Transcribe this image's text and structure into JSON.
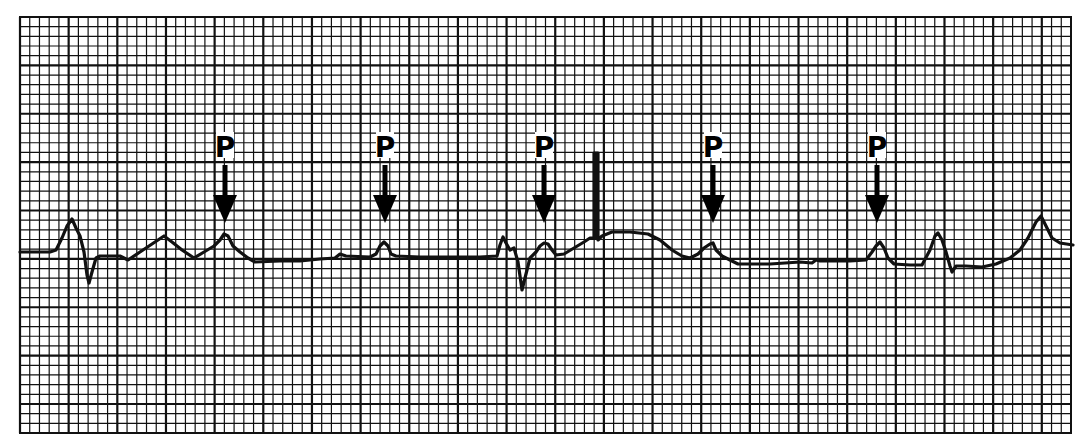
{
  "figure": {
    "kind": "ECG rhythm strip",
    "background_color": "#ffffff",
    "grid_color": "#111111",
    "trace_color": "#111111",
    "grid": {
      "left": 20,
      "top": 17,
      "right": 1071,
      "bottom": 433,
      "small_square_px": 9.74,
      "major_every": 5
    }
  },
  "annotations": {
    "marker_label": "P",
    "markers": [
      {
        "label": "P",
        "x": 225
      },
      {
        "label": "P",
        "x": 385
      },
      {
        "label": "P",
        "x": 544
      },
      {
        "label": "P",
        "x": 713
      },
      {
        "label": "P",
        "x": 877
      }
    ],
    "label_top": 133,
    "label_bottom": 157,
    "arrow_shaft_top": 165,
    "arrow_head_top": 195,
    "arrow_tip_y": 223
  },
  "trace": {
    "points": [
      [
        20,
        252
      ],
      [
        50,
        252
      ],
      [
        56,
        250
      ],
      [
        62,
        238
      ],
      [
        67,
        226
      ],
      [
        72,
        219
      ],
      [
        76,
        228
      ],
      [
        80,
        236
      ],
      [
        84,
        252
      ],
      [
        87,
        275
      ],
      [
        89,
        283
      ],
      [
        92,
        272
      ],
      [
        96,
        258
      ],
      [
        100,
        256
      ],
      [
        120,
        256
      ],
      [
        128,
        260
      ],
      [
        140,
        252
      ],
      [
        152,
        244
      ],
      [
        164,
        236
      ],
      [
        172,
        242
      ],
      [
        182,
        250
      ],
      [
        194,
        258
      ],
      [
        204,
        252
      ],
      [
        214,
        246
      ],
      [
        220,
        240
      ],
      [
        224,
        234
      ],
      [
        228,
        236
      ],
      [
        233,
        246
      ],
      [
        240,
        252
      ],
      [
        248,
        258
      ],
      [
        255,
        262
      ],
      [
        280,
        261
      ],
      [
        300,
        261
      ],
      [
        320,
        259
      ],
      [
        335,
        258
      ],
      [
        340,
        254
      ],
      [
        346,
        256
      ],
      [
        370,
        257
      ],
      [
        376,
        254
      ],
      [
        380,
        246
      ],
      [
        384,
        242
      ],
      [
        388,
        246
      ],
      [
        391,
        254
      ],
      [
        396,
        256
      ],
      [
        420,
        257
      ],
      [
        450,
        257
      ],
      [
        480,
        257
      ],
      [
        497,
        256
      ],
      [
        500,
        245
      ],
      [
        503,
        237
      ],
      [
        506,
        243
      ],
      [
        510,
        250
      ],
      [
        514,
        248
      ],
      [
        518,
        262
      ],
      [
        522,
        290
      ],
      [
        526,
        274
      ],
      [
        530,
        258
      ],
      [
        536,
        252
      ],
      [
        540,
        246
      ],
      [
        544,
        243
      ],
      [
        548,
        244
      ],
      [
        552,
        250
      ],
      [
        556,
        255
      ],
      [
        564,
        254
      ],
      [
        574,
        248
      ],
      [
        584,
        242
      ],
      [
        590,
        238
      ],
      [
        594,
        238
      ],
      [
        594,
        153
      ],
      [
        598,
        153
      ],
      [
        598,
        240
      ],
      [
        602,
        236
      ],
      [
        612,
        232
      ],
      [
        630,
        232
      ],
      [
        648,
        234
      ],
      [
        660,
        240
      ],
      [
        672,
        250
      ],
      [
        682,
        256
      ],
      [
        690,
        258
      ],
      [
        698,
        254
      ],
      [
        704,
        248
      ],
      [
        710,
        244
      ],
      [
        713,
        243
      ],
      [
        716,
        250
      ],
      [
        722,
        256
      ],
      [
        730,
        260
      ],
      [
        738,
        264
      ],
      [
        750,
        264
      ],
      [
        770,
        264
      ],
      [
        785,
        263
      ],
      [
        800,
        262
      ],
      [
        812,
        263
      ],
      [
        816,
        260
      ],
      [
        820,
        261
      ],
      [
        832,
        261
      ],
      [
        850,
        261
      ],
      [
        866,
        260
      ],
      [
        872,
        252
      ],
      [
        876,
        246
      ],
      [
        880,
        242
      ],
      [
        884,
        248
      ],
      [
        888,
        258
      ],
      [
        894,
        264
      ],
      [
        910,
        265
      ],
      [
        922,
        265
      ],
      [
        930,
        250
      ],
      [
        935,
        236
      ],
      [
        938,
        233
      ],
      [
        942,
        240
      ],
      [
        946,
        252
      ],
      [
        950,
        266
      ],
      [
        952,
        272
      ],
      [
        956,
        266
      ],
      [
        966,
        266
      ],
      [
        982,
        267
      ],
      [
        996,
        264
      ],
      [
        1010,
        258
      ],
      [
        1020,
        250
      ],
      [
        1028,
        238
      ],
      [
        1036,
        222
      ],
      [
        1041,
        216
      ],
      [
        1046,
        226
      ],
      [
        1052,
        238
      ],
      [
        1060,
        243
      ],
      [
        1073,
        245
      ]
    ],
    "pacer_spike": {
      "x": 596,
      "top": 153,
      "bottom": 240
    }
  }
}
